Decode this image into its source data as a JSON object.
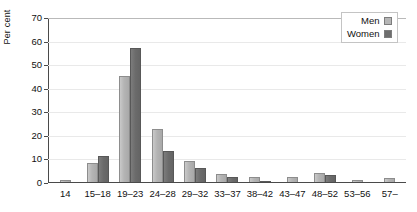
{
  "chart_data": {
    "type": "bar",
    "title": "",
    "xlabel": "",
    "ylabel": "Per cent",
    "ylim": [
      0,
      70
    ],
    "yticks": [
      0,
      10,
      20,
      30,
      40,
      50,
      60,
      70
    ],
    "grid": true,
    "legend_position": "top-right",
    "categories": [
      "14",
      "15–18",
      "19–23",
      "24–28",
      "29–32",
      "33–37",
      "38–42",
      "43–47",
      "48–52",
      "53–56",
      "57–"
    ],
    "series": [
      {
        "name": "Men",
        "color": "#b4b4b4",
        "values": [
          1,
          8,
          45,
          22.5,
          9,
          3.5,
          2,
          2,
          4,
          1,
          1.5
        ]
      },
      {
        "name": "Women",
        "color": "#6b6b6b",
        "values": [
          0,
          11,
          57,
          13,
          6,
          2,
          0.5,
          0,
          3,
          0,
          0
        ]
      }
    ]
  },
  "legend": {
    "items": [
      {
        "label": "Men",
        "swatch": "men-swatch"
      },
      {
        "label": "Women",
        "swatch": "women-swatch"
      }
    ]
  }
}
